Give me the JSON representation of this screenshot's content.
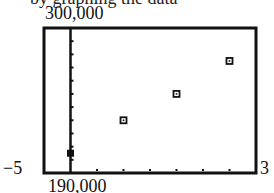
{
  "cutoff_text": "by graphing the data",
  "window": {
    "ymax_label": "300,000",
    "ymin_label": "190,000",
    "xmin_label": "−5",
    "xmax_label": "3"
  },
  "chart_data": {
    "type": "scatter",
    "title": "",
    "xlabel": "",
    "ylabel": "",
    "xlim": [
      -5,
      35
    ],
    "ylim": [
      190000,
      300000
    ],
    "xscale": 5,
    "yscale": 10000,
    "grid": false,
    "legend": null,
    "series": [
      {
        "name": "data",
        "marker": "square",
        "x": [
          0,
          10,
          20,
          30
        ],
        "y": [
          205000,
          230000,
          250000,
          275000
        ]
      }
    ]
  },
  "style": {
    "frame_color": "#111111",
    "marker_color": "#111111",
    "background": "#ffffff"
  }
}
